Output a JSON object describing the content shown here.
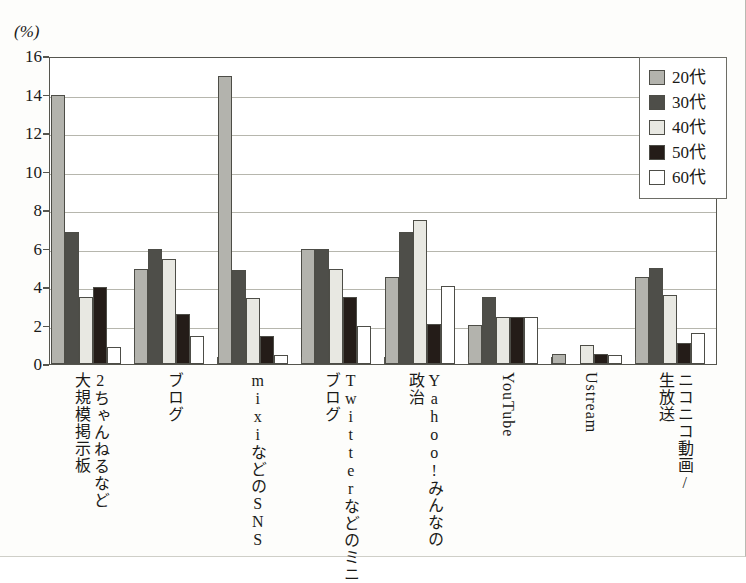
{
  "chart_data": {
    "type": "bar",
    "title": "",
    "xlabel": "",
    "ylabel": "(%)",
    "unit_label": "(%)",
    "ylim": [
      0,
      16
    ],
    "ytick_values": [
      0,
      2,
      4,
      6,
      8,
      10,
      12,
      14,
      16
    ],
    "ytick_labels": [
      "0",
      "2",
      "4",
      "6",
      "8",
      "10",
      "12",
      "14",
      "16"
    ],
    "grid": true,
    "legend_position": "top-right",
    "categories": [
      "2ちゃんねるなど大規模掲示板",
      "ブログ",
      "mixiなどのSNS",
      "Twitterなどのミニブログ",
      "Yahoo!みんなの政治",
      "YouTube",
      "Ustream",
      "ニコニコ動画/生放送"
    ],
    "category_columns": [
      [
        "2ちゃんねるなど",
        "大規模掲示板"
      ],
      [
        "ブログ"
      ],
      [
        "mixiなどのSNS"
      ],
      [
        "Twitterなどのミニ",
        "ブログ"
      ],
      [
        "Yahoo!みんなの",
        "政治"
      ],
      [
        "YouTube"
      ],
      [
        "Ustream"
      ],
      [
        "ニコニコ動画/",
        "生放送"
      ]
    ],
    "series": [
      {
        "name": "20代",
        "color": "#b3b3ad",
        "values": [
          14.0,
          4.95,
          14.95,
          6.0,
          4.5,
          2.05,
          0.5,
          4.5
        ]
      },
      {
        "name": "30代",
        "color": "#4e4e49",
        "values": [
          6.85,
          6.0,
          4.9,
          6.0,
          6.85,
          3.5,
          0.0,
          5.0
        ]
      },
      {
        "name": "40代",
        "color": "#e8e8e2",
        "values": [
          3.5,
          5.45,
          3.45,
          4.95,
          7.5,
          2.45,
          1.0,
          3.6
        ]
      },
      {
        "name": "50代",
        "color": "#241c18",
        "values": [
          4.0,
          2.6,
          1.45,
          3.5,
          2.1,
          2.45,
          0.5,
          1.1
        ]
      },
      {
        "name": "60代",
        "color": "#ffffff",
        "values": [
          0.9,
          1.45,
          0.45,
          2.0,
          4.05,
          2.45,
          0.45,
          1.6
        ]
      }
    ]
  },
  "legend": {
    "items": [
      {
        "label": "20代",
        "swatch": "#b3b3ad"
      },
      {
        "label": "30代",
        "swatch": "#4e4e49"
      },
      {
        "label": "40代",
        "swatch": "#e8e8e2"
      },
      {
        "label": "50代",
        "swatch": "#241c18"
      },
      {
        "label": "60代",
        "swatch": "#ffffff"
      }
    ]
  }
}
